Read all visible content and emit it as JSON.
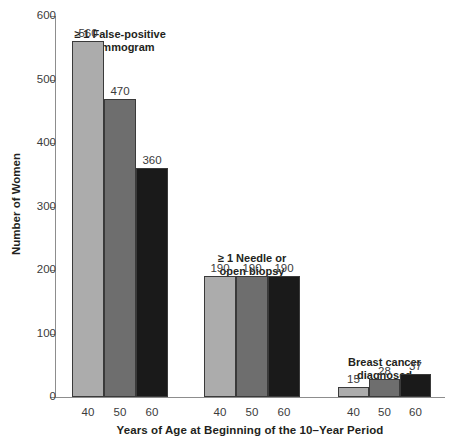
{
  "chart_data": {
    "type": "bar",
    "title": "",
    "xlabel": "Years of Age at Beginning of the 10–Year Period",
    "ylabel": "Number of Women",
    "ylim": [
      0,
      600
    ],
    "ytick_labels": [
      "600",
      "500",
      "400",
      "300",
      "200",
      "100",
      "0"
    ],
    "ytick_values": [
      600,
      500,
      400,
      300,
      200,
      100,
      0
    ],
    "grid": false,
    "legend_position": "none",
    "categories": [
      "40",
      "50",
      "60"
    ],
    "series": [
      {
        "name": "40",
        "values": [
          560,
          190,
          15
        ],
        "color": "#acacac"
      },
      {
        "name": "50",
        "values": [
          470,
          190,
          28
        ],
        "color": "#6e6e6e"
      },
      {
        "name": "60",
        "values": [
          360,
          190,
          37
        ],
        "color": "#1a1a1a"
      }
    ],
    "groups": [
      {
        "label_line1": "≥ 1 False-positive",
        "label_line2": "mammogram",
        "bars": [
          {
            "tick": "40",
            "value": 560,
            "value_label": "560",
            "color": "#acacac"
          },
          {
            "tick": "50",
            "value": 470,
            "value_label": "470",
            "color": "#6e6e6e"
          },
          {
            "tick": "60",
            "value": 360,
            "value_label": "360",
            "color": "#1a1a1a"
          }
        ]
      },
      {
        "label_line1": "≥ 1 Needle or",
        "label_line2": "open biopsy",
        "bars": [
          {
            "tick": "40",
            "value": 190,
            "value_label": "190",
            "color": "#acacac"
          },
          {
            "tick": "50",
            "value": 190,
            "value_label": "190",
            "color": "#6e6e6e"
          },
          {
            "tick": "60",
            "value": 190,
            "value_label": "190",
            "color": "#1a1a1a"
          }
        ]
      },
      {
        "label_line1": "Breast cancer",
        "label_line2": "diagnosed",
        "bars": [
          {
            "tick": "40",
            "value": 15,
            "value_label": "15",
            "color": "#acacac"
          },
          {
            "tick": "50",
            "value": 28,
            "value_label": "28",
            "color": "#6e6e6e"
          },
          {
            "tick": "60",
            "value": 37,
            "value_label": "37",
            "color": "#1a1a1a"
          }
        ]
      }
    ],
    "colors": {
      "bar_light": "#acacac",
      "bar_medium": "#6e6e6e",
      "bar_dark": "#1a1a1a",
      "axis": "#8d8d8d",
      "text": "#231f20"
    }
  }
}
